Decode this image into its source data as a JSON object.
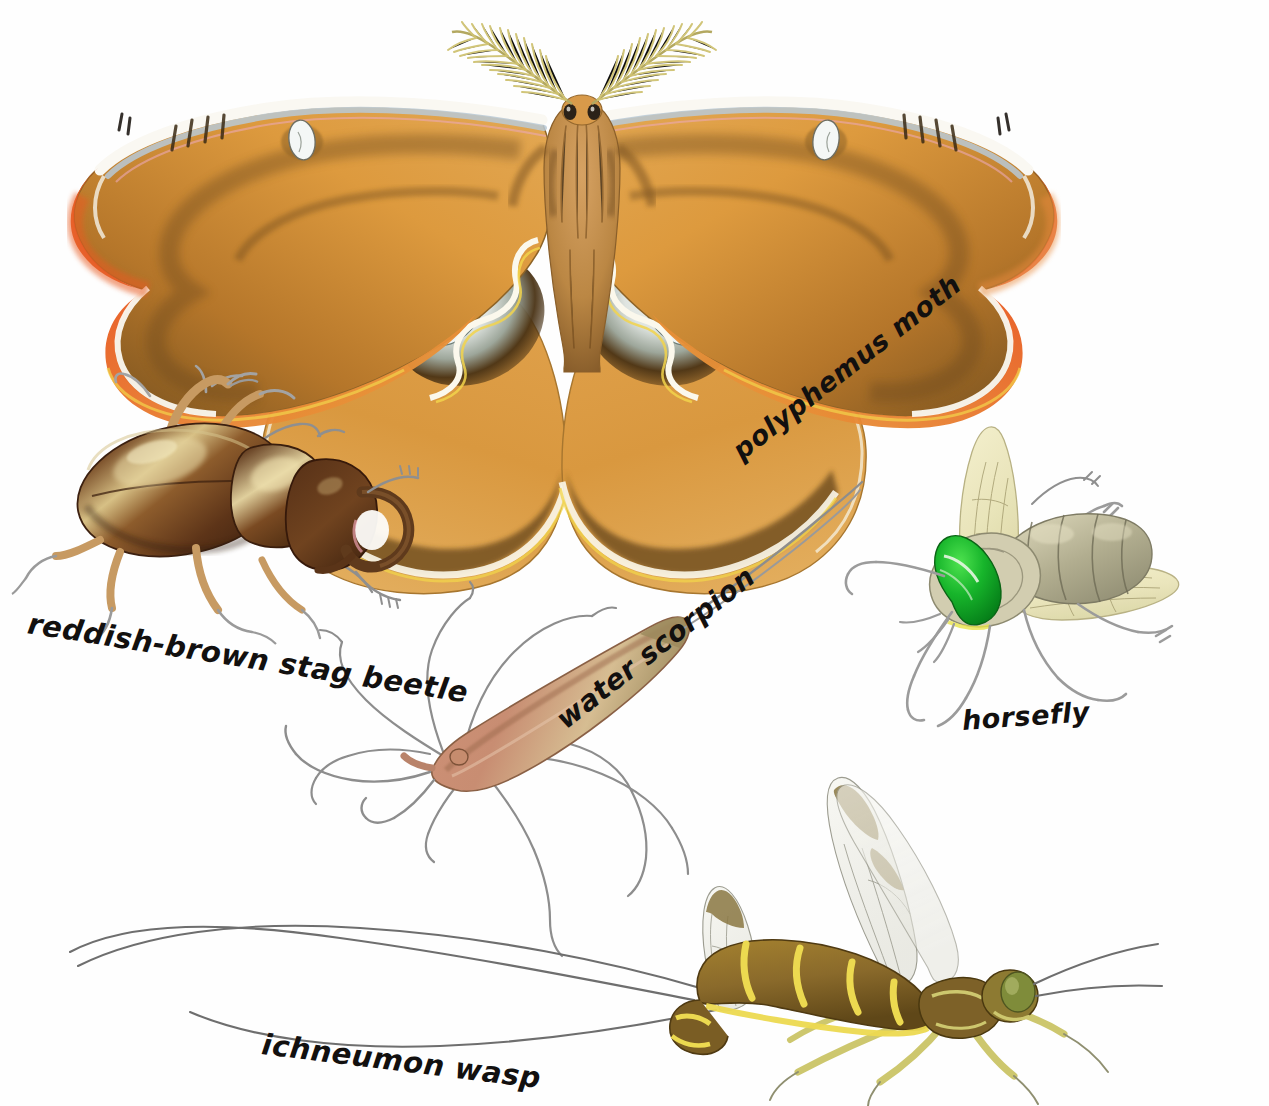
{
  "plate": {
    "title": "Insect illustration plate",
    "medium": "colored pencil and ink natural history illustration",
    "background_color": "#ffffff",
    "width": 1269,
    "height": 1106
  },
  "specimens": [
    {
      "id": "polyphemus-moth",
      "label": "polyphemus moth",
      "label_rotation_deg": -38,
      "position": "top center",
      "colors": {
        "wing_main": "#dd9a3e",
        "wing_shadow": "#6d4a1e",
        "margin_band": "#e4913a",
        "outer_red": "#e0602a",
        "costal_white": "#f6f3ec",
        "costal_blue": "#b9c9d6",
        "eyespot_center": "#e8edef",
        "eyespot_ring": "#4d3313",
        "antenna": "#ded79a",
        "body_fur": "#c98f4d",
        "yellow_edge": "#f2d44b",
        "pink_edge": "#eda7b4"
      }
    },
    {
      "id": "reddish-brown-stag-beetle",
      "label": "reddish-brown stag beetle",
      "label_rotation_deg": 9,
      "position": "left middle",
      "colors": {
        "elytra": "#6b3d22",
        "elytra_highlight": "#d9c289",
        "pronotum": "#5b3218",
        "head": "#54301a",
        "mandible": "#6b4124",
        "leg": "#c89a63",
        "tarsus": "#8b8b8b"
      }
    },
    {
      "id": "water-scorpion",
      "label": "water scorpion",
      "label_rotation_deg": -38,
      "position": "center",
      "colors": {
        "body": "#cd9078",
        "body_light": "#d9c193",
        "body_shadow": "#8b6045",
        "legs": "#8d8d8d"
      }
    },
    {
      "id": "horsefly",
      "label": "horsefly",
      "label_rotation_deg": -4,
      "position": "right middle",
      "colors": {
        "eye": "#16b02a",
        "eye_dark": "#0a7a1c",
        "thorax": "#cfc9ab",
        "abdomen_band": "#8f8d74",
        "abdomen_light": "#d8d3b6",
        "wing": "#eeeac4",
        "leg": "#9b9b9b"
      }
    },
    {
      "id": "ichneumon-wasp",
      "label": "ichneumon wasp",
      "label_rotation_deg": 7,
      "position": "bottom",
      "colors": {
        "abdomen": "#8a6a2b",
        "abdomen_band": "#ecd950",
        "thorax": "#7d6128",
        "eye": "#7f8c3a",
        "leg": "#ddd77c",
        "wing": "#efefe8",
        "wing_patch": "#8a7742",
        "ovipositor": "#6e6e6e"
      }
    }
  ]
}
